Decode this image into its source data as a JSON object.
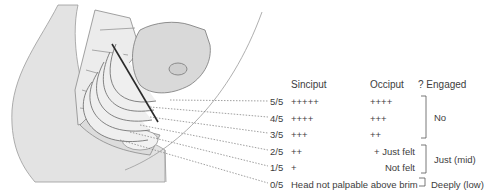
{
  "headers": {
    "sinciput": "Sinciput",
    "occiput": "Occiput",
    "engaged": "? Engaged"
  },
  "rows": [
    {
      "fifths": "5/5",
      "sinciput": "+++++",
      "occiput": "++++"
    },
    {
      "fifths": "4/5",
      "sinciput": "++++",
      "occiput": "+++"
    },
    {
      "fifths": "3/5",
      "sinciput": "+++",
      "occiput": "++"
    },
    {
      "fifths": "2/5",
      "sinciput": "++",
      "occiput": "+ Just felt"
    },
    {
      "fifths": "1/5",
      "sinciput": "+",
      "occiput": "Not felt"
    },
    {
      "fifths": "0/5",
      "sinciput": "Head not palpable above brim",
      "occiput": ""
    }
  ],
  "groups": [
    {
      "label": "No",
      "rows": "5/5–3/5"
    },
    {
      "label": "Just (mid)",
      "rows": "2/5–1/5"
    },
    {
      "label": "Deeply (low)",
      "rows": "0/5"
    }
  ],
  "colors": {
    "fill": "#e3e3e3",
    "line": "#7a7a7a",
    "axis": "#2a2a2a",
    "text": "#3d3d3d"
  }
}
